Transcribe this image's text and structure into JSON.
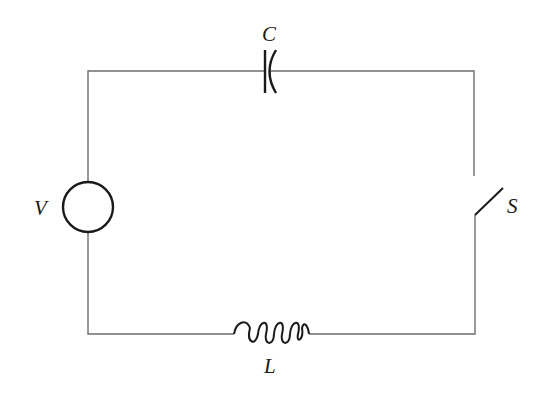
{
  "diagram": {
    "type": "series RLC circuit with switch",
    "colors": {
      "wire": "#6e6e6e",
      "component": "#1a1a1a",
      "background": "#ffffff"
    },
    "components": [
      {
        "id": "source",
        "kind": "voltage-source",
        "label": "V",
        "position": "left"
      },
      {
        "id": "capacitor",
        "kind": "capacitor",
        "label": "C",
        "position": "top"
      },
      {
        "id": "switch",
        "kind": "switch-open",
        "label": "S",
        "position": "right"
      },
      {
        "id": "inductor",
        "kind": "inductor",
        "label": "L",
        "position": "bottom"
      }
    ],
    "labels": {
      "capacitor": "C",
      "source": "V",
      "switch": "S",
      "inductor": "L"
    }
  }
}
